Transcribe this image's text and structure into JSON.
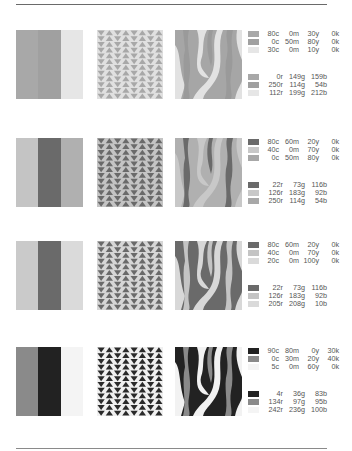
{
  "page": {
    "rows": [
      {
        "stripes": [
          "#a8a8a8",
          "#a0a0a0",
          "#e6e6e6"
        ],
        "triangles": {
          "bg": "#e0e0e0",
          "fg": "#a8a8a8"
        },
        "wave": {
          "base": "#a6a6a6",
          "band": "#9a9a9a",
          "light": "#e2e2e2"
        },
        "cmyk": [
          {
            "swatch": "#a8a8a8",
            "c": "80c",
            "m": "0m",
            "y": "30y",
            "k": "0k"
          },
          {
            "swatch": "#a0a0a0",
            "c": "0c",
            "m": "50m",
            "y": "80y",
            "k": "0k"
          },
          {
            "swatch": "#e6e6e6",
            "c": "30c",
            "m": "0m",
            "y": "10y",
            "k": "0k"
          }
        ],
        "rgb": [
          {
            "swatch": "#a8a8a8",
            "r": "0r",
            "g": "149g",
            "b": "159b"
          },
          {
            "swatch": "#a0a0a0",
            "r": "250r",
            "g": "114g",
            "b": "54b"
          },
          {
            "swatch": "#e6e6e6",
            "r": "112r",
            "g": "199g",
            "b": "212b"
          }
        ]
      },
      {
        "stripes": [
          "#c4c4c4",
          "#6a6a6a",
          "#b0b0b0"
        ],
        "triangles": {
          "bg": "#c4c4c4",
          "fg": "#6a6a6a"
        },
        "wave": {
          "base": "#b0b0b0",
          "band": "#6a6a6a",
          "light": "#c8c8c8"
        },
        "cmyk": [
          {
            "swatch": "#6a6a6a",
            "c": "80c",
            "m": "60m",
            "y": "20y",
            "k": "0k"
          },
          {
            "swatch": "#c8c8c8",
            "c": "40c",
            "m": "0m",
            "y": "70y",
            "k": "0k"
          },
          {
            "swatch": "#a8a8a8",
            "c": "0c",
            "m": "50m",
            "y": "80y",
            "k": "0k"
          }
        ],
        "rgb": [
          {
            "swatch": "#6a6a6a",
            "r": "22r",
            "g": "73g",
            "b": "116b"
          },
          {
            "swatch": "#c8c8c8",
            "r": "126r",
            "g": "183g",
            "b": "92b"
          },
          {
            "swatch": "#a8a8a8",
            "r": "250r",
            "g": "114g",
            "b": "54b"
          }
        ]
      },
      {
        "stripes": [
          "#cacaca",
          "#6a6a6a",
          "#dadada"
        ],
        "triangles": {
          "bg": "#d6d6d6",
          "fg": "#6a6a6a"
        },
        "wave": {
          "base": "#6a6a6a",
          "band": "#c4c4c4",
          "light": "#d8d8d8"
        },
        "cmyk": [
          {
            "swatch": "#6a6a6a",
            "c": "80c",
            "m": "60m",
            "y": "20y",
            "k": "0k"
          },
          {
            "swatch": "#c4c4c4",
            "c": "40c",
            "m": "0m",
            "y": "70y",
            "k": "0k"
          },
          {
            "swatch": "#dadada",
            "c": "20c",
            "m": "0m",
            "y": "100y",
            "k": "0k"
          }
        ],
        "rgb": [
          {
            "swatch": "#6a6a6a",
            "r": "22r",
            "g": "73g",
            "b": "116b"
          },
          {
            "swatch": "#c4c4c4",
            "r": "126r",
            "g": "183g",
            "b": "92b"
          },
          {
            "swatch": "#dadada",
            "r": "205r",
            "g": "208g",
            "b": "10b"
          }
        ]
      },
      {
        "stripes": [
          "#8a8a8a",
          "#222222",
          "#f4f4f4"
        ],
        "triangles": {
          "bg": "#f0f0f0",
          "fg": "#2a2a2a"
        },
        "wave": {
          "base": "#222222",
          "band": "#8a8a8a",
          "light": "#f2f2f2"
        },
        "cmyk": [
          {
            "swatch": "#222222",
            "c": "90c",
            "m": "80m",
            "y": "0y",
            "k": "30k"
          },
          {
            "swatch": "#8a8a8a",
            "c": "0c",
            "m": "30m",
            "y": "20y",
            "k": "40k"
          },
          {
            "swatch": "#f4f4f4",
            "c": "5c",
            "m": "0m",
            "y": "60y",
            "k": "0k"
          }
        ],
        "rgb": [
          {
            "swatch": "#222222",
            "r": "4r",
            "g": "36g",
            "b": "83b"
          },
          {
            "swatch": "#8a8a8a",
            "r": "134r",
            "g": "97g",
            "b": "95b"
          },
          {
            "swatch": "#f4f4f4",
            "r": "242r",
            "g": "236g",
            "b": "100b"
          }
        ]
      }
    ]
  }
}
